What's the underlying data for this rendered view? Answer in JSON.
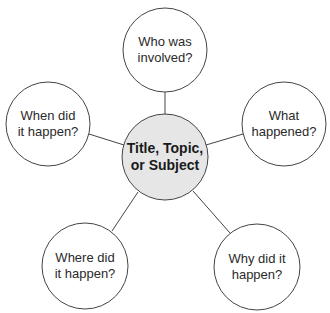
{
  "diagram": {
    "type": "web-organizer",
    "colors": {
      "center_fill": "#e6e6e6",
      "outer_fill": "#ffffff",
      "stroke": "#444444"
    },
    "center": {
      "label": "Title, Topic, or Subject",
      "lines": [
        "Title, Topic,",
        "or Subject"
      ]
    },
    "nodes": [
      {
        "id": "who",
        "lines": [
          "Who was",
          "involved?"
        ]
      },
      {
        "id": "what",
        "lines": [
          "What",
          "happened?"
        ]
      },
      {
        "id": "why",
        "lines": [
          "Why did it",
          "happen?"
        ]
      },
      {
        "id": "where",
        "lines": [
          "Where did",
          "it happen?"
        ]
      },
      {
        "id": "when",
        "lines": [
          "When did",
          "it happen?"
        ]
      }
    ]
  }
}
